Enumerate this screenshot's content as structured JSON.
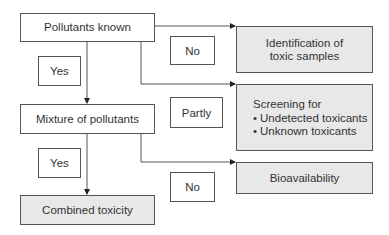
{
  "diagram": {
    "type": "flowchart",
    "nodes": {
      "pollutants_known": "Pollutants known",
      "mixture": "Mixture of pollutants",
      "combined": "Combined toxicity",
      "identification_line1": "Identification of",
      "identification_line2": "toxic samples",
      "screening_title": "Screening for",
      "screening_items": [
        "Undetected toxicants",
        "Unknown toxicants"
      ],
      "bioavailability": "Bioavailability"
    },
    "edge_labels": {
      "yes_1": "Yes",
      "no_1": "No",
      "partly": "Partly",
      "yes_2": "Yes",
      "no_2": "No"
    },
    "edges": [
      {
        "from": "Pollutants known",
        "to": "Mixture of pollutants",
        "label": "Yes"
      },
      {
        "from": "Pollutants known",
        "to": "Identification of toxic samples",
        "label": "No"
      },
      {
        "from": "Pollutants known",
        "to": "Screening for",
        "label": "Partly"
      },
      {
        "from": "Mixture of pollutants",
        "to": "Combined toxicity",
        "label": "Yes"
      },
      {
        "from": "Mixture of pollutants",
        "to": "Bioavailability",
        "label": "No"
      }
    ],
    "colors": {
      "line": "#555555",
      "shaded_box": "#e8e8e8",
      "plain_box": "#ffffff"
    }
  }
}
